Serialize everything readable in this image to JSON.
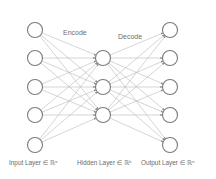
{
  "diagram": {
    "section_labels": {
      "encode": "Encode",
      "decode": "Decode"
    },
    "layers": [
      {
        "name": "input",
        "label": "Input Layer ∈ ℝⁿ",
        "node_count": 5
      },
      {
        "name": "hidden",
        "label": "Hidden Layer ∈ ℝᵏ",
        "node_count": 3
      },
      {
        "name": "output",
        "label": "Output Layer ∈ ℝⁿ",
        "node_count": 5
      }
    ],
    "connections": "fully-connected between adjacent layers, arrows pointing toward next layer",
    "colors": {
      "edge": "#b9b9b9",
      "node_stroke": "#7a7a7a",
      "text": "#6e6e6e",
      "background": "#ffffff"
    }
  }
}
